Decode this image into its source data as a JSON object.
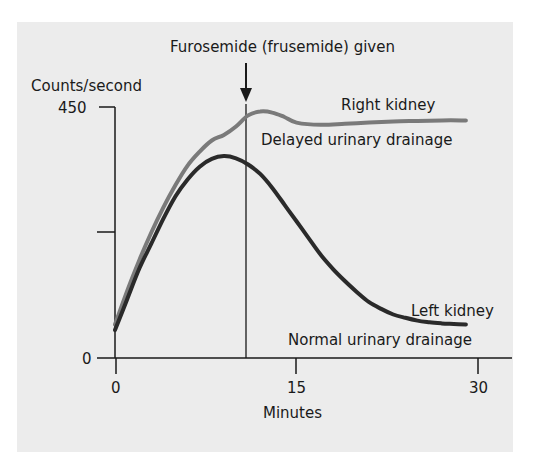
{
  "chart_data": {
    "type": "line",
    "title": "",
    "xlabel": "Minutes",
    "ylabel": "Counts/second",
    "xlim": [
      0,
      30
    ],
    "ylim": [
      0,
      450
    ],
    "x_ticks": [
      0,
      15,
      30
    ],
    "x_tick_labels": [
      "0",
      "15",
      "30"
    ],
    "y_ticks": [
      0,
      225,
      450
    ],
    "y_tick_labels": [
      "0",
      "",
      "450"
    ],
    "grid": false,
    "legend": "none (direct curve labels)",
    "annotations": [
      {
        "text": "Furosemide (frusemide) given",
        "x": 10.8,
        "type": "arrow + vertical line"
      }
    ],
    "series": [
      {
        "name": "Right kidney",
        "sublabel": "Delayed urinary drainage",
        "color": "#7a7a7a",
        "x": [
          0,
          1,
          2,
          3,
          4,
          5,
          6,
          7,
          8,
          9,
          10,
          11,
          12,
          13,
          14,
          15,
          17,
          19,
          21,
          23,
          25,
          27,
          29
        ],
        "values": [
          60,
          120,
          175,
          225,
          270,
          310,
          345,
          370,
          390,
          400,
          415,
          435,
          442,
          440,
          432,
          422,
          418,
          420,
          422,
          424,
          425,
          426,
          426
        ]
      },
      {
        "name": "Left kidney",
        "sublabel": "Normal urinary drainage",
        "color": "#2a2a2a",
        "x": [
          0,
          1,
          2,
          3,
          4,
          5,
          6,
          7,
          8,
          9,
          10,
          11,
          12,
          13,
          14,
          15,
          16,
          17,
          18,
          19,
          20,
          21,
          22,
          23,
          24,
          25,
          26,
          27,
          28,
          29
        ],
        "values": [
          50,
          105,
          160,
          205,
          250,
          290,
          320,
          343,
          357,
          362,
          358,
          347,
          330,
          305,
          275,
          245,
          215,
          185,
          160,
          138,
          118,
          100,
          88,
          78,
          72,
          67,
          64,
          62,
          61,
          60
        ]
      }
    ]
  },
  "labels": {
    "annotation": "Furosemide (frusemide) given",
    "y_axis_title": "Counts/second",
    "y_top": "450",
    "y_zero": "0",
    "x_0": "0",
    "x_15": "15",
    "x_30": "30",
    "x_axis_title": "Minutes",
    "right_name": "Right kidney",
    "right_desc": "Delayed urinary drainage",
    "left_name": "Left kidney",
    "left_desc": "Normal urinary drainage"
  }
}
